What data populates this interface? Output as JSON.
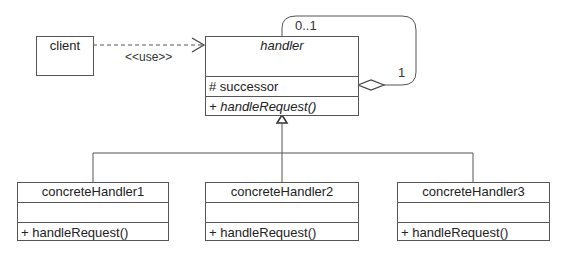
{
  "diagram": {
    "type": "UML class diagram",
    "classes": {
      "client": {
        "name": "client"
      },
      "handler": {
        "name": "handler",
        "abstract": true,
        "attributes": [
          "# successor"
        ],
        "operations": [
          "+ handleRequest()"
        ]
      },
      "concrete": [
        {
          "name": "concreteHandler1",
          "operations": [
            "+ handleRequest()"
          ]
        },
        {
          "name": "concreteHandler2",
          "operations": [
            "+ handleRequest()"
          ]
        },
        {
          "name": "concreteHandler3",
          "operations": [
            "+ handleRequest()"
          ]
        }
      ]
    },
    "relations": {
      "dependency": {
        "from": "client",
        "to": "handler",
        "label": "<<use>>"
      },
      "aggregation": {
        "from": "handler",
        "to": "handler",
        "multiplicity_target": "0..1",
        "multiplicity_source": "1"
      },
      "generalization": {
        "parent": "handler",
        "children": [
          "concreteHandler1",
          "concreteHandler2",
          "concreteHandler3"
        ]
      }
    }
  },
  "colors": {
    "line": "#555555",
    "text": "#222222",
    "background": "#ffffff"
  }
}
